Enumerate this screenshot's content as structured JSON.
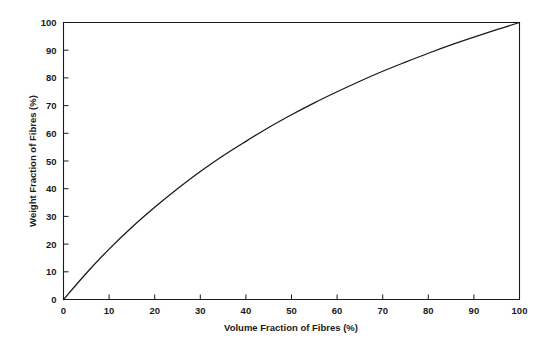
{
  "chart_data": {
    "type": "line",
    "title": "",
    "subtitle": "",
    "xlabel": "Volume Fraction of Fibres (%)",
    "ylabel": "Weight Fraction of Fibres (%)",
    "xlim": [
      0,
      100
    ],
    "ylim": [
      0,
      100
    ],
    "grid": false,
    "legend": null,
    "xticks": [
      0,
      10,
      20,
      30,
      40,
      50,
      60,
      70,
      80,
      90,
      100
    ],
    "xtick_labels": [
      "0",
      "10",
      "20",
      "30",
      "40",
      "50",
      "60",
      "70",
      "80",
      "90",
      "100"
    ],
    "yticks": [
      0,
      10,
      20,
      30,
      40,
      50,
      60,
      70,
      80,
      90,
      100
    ],
    "ytick_labels": [
      "0",
      "10",
      "20",
      "30",
      "40",
      "50",
      "60",
      "70",
      "80",
      "90",
      "100"
    ],
    "series": [
      {
        "name": "Weight fraction vs volume fraction",
        "x": [
          0,
          5,
          10,
          15,
          20,
          25,
          30,
          35,
          40,
          45,
          50,
          55,
          60,
          65,
          70,
          75,
          80,
          85,
          90,
          95,
          100
        ],
        "y": [
          0,
          9.5,
          18.2,
          26.1,
          33.3,
          40.0,
          46.2,
          51.9,
          57.1,
          62.1,
          66.7,
          71.0,
          75.0,
          78.8,
          82.4,
          85.7,
          88.9,
          91.9,
          94.7,
          97.4,
          100
        ],
        "color": "#1a1a1a",
        "style": "solid",
        "width": 1.3,
        "markers": "none"
      }
    ],
    "annotations": []
  },
  "axes": {
    "x_axis_title": "Volume Fraction of Fibres (%)",
    "y_axis_title": "Weight Fraction of Fibres (%)"
  },
  "style": {
    "background": "#ffffff",
    "line_color": "#1a1a1a",
    "text_color": "#1a1a1a",
    "frame_color": "#1a1a1a"
  }
}
